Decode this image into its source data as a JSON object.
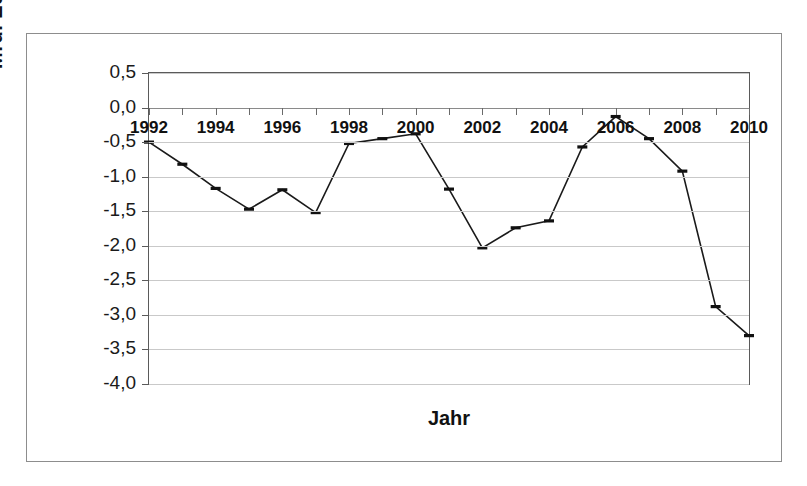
{
  "chart_data": {
    "type": "line",
    "title": "",
    "xlabel": "Jahr",
    "ylabel": "Mrd. Euro",
    "xlim": [
      1992,
      2010
    ],
    "ylim": [
      -4.0,
      0.5
    ],
    "grid": true,
    "legend": "none",
    "decimal_separator": ",",
    "x": [
      1992,
      1993,
      1994,
      1995,
      1996,
      1997,
      1998,
      1999,
      2000,
      2001,
      2002,
      2003,
      2004,
      2005,
      2006,
      2007,
      2008,
      2009,
      2010
    ],
    "values": [
      -0.5,
      -0.82,
      -1.17,
      -1.47,
      -1.19,
      -1.52,
      -0.52,
      -0.45,
      -0.38,
      -1.18,
      -2.03,
      -1.74,
      -1.64,
      -0.57,
      -0.13,
      -0.45,
      -0.92,
      -2.88,
      -3.3
    ],
    "ytick_labels": [
      "0,5",
      "0,0",
      "-0,5",
      "-1,0",
      "-1,5",
      "-2,0",
      "-2,5",
      "-3,0",
      "-3,5",
      "-4,0"
    ],
    "ytick_values": [
      0.5,
      0.0,
      -0.5,
      -1.0,
      -1.5,
      -2.0,
      -2.5,
      -3.0,
      -3.5,
      -4.0
    ],
    "xtick_labels": [
      "1992",
      "1994",
      "1996",
      "1998",
      "2000",
      "2002",
      "2004",
      "2006",
      "2008",
      "2010"
    ],
    "xtick_values": [
      1992,
      1994,
      1996,
      1998,
      2000,
      2002,
      2004,
      2006,
      2008,
      2010
    ],
    "series_color": "#1a1a1a",
    "grid_color": "#c9c9c9",
    "marker": "dash"
  }
}
